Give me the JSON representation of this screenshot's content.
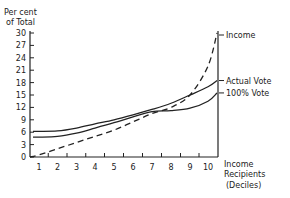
{
  "chart_data": {
    "type": "line",
    "title": "",
    "ylabel": "Per cent of Total",
    "ylabel_lines": [
      "Per cent",
      "of Total"
    ],
    "xlabel": "Income Recipients (Deciles)",
    "xlabel_lines": [
      "Income",
      "Recipients",
      "(Deciles)"
    ],
    "x": [
      1,
      2,
      3,
      4,
      5,
      6,
      7,
      8,
      9,
      10
    ],
    "x_tick_labels": [
      "1",
      "2",
      "3",
      "4",
      "5",
      "6",
      "7",
      "8",
      "9",
      "10"
    ],
    "y_ticks": [
      0,
      3,
      6,
      9,
      12,
      15,
      18,
      21,
      24,
      27,
      30
    ],
    "ylim": [
      0,
      30
    ],
    "xlim": [
      0.5,
      11.1
    ],
    "grid": false,
    "legend_position": "right (inline line labels)",
    "series": [
      {
        "name": "Income",
        "style": "dashed",
        "values": [
          0.5,
          2,
          3.5,
          5,
          6.5,
          8.5,
          10.5,
          12,
          15,
          22
        ],
        "end_value": 30
      },
      {
        "name": "Actual Vote",
        "style": "solid",
        "values": [
          6.2,
          6.3,
          7,
          8,
          9,
          10.2,
          11.5,
          13,
          15,
          17
        ],
        "end_value": 18.5
      },
      {
        "name": "100% Vote",
        "style": "solid",
        "values": [
          4.8,
          5,
          5.8,
          7,
          8.3,
          9.7,
          11,
          11.2,
          11.8,
          13.5
        ],
        "end_value": 15.5
      }
    ]
  }
}
